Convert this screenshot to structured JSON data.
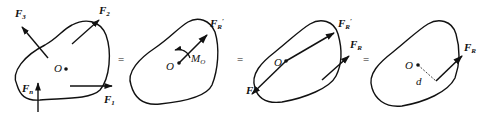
{
  "diagram": {
    "panels": [
      {
        "id": "original-force-system",
        "point": "O",
        "forces": [
          {
            "label": "F",
            "sub": "1"
          },
          {
            "label": "F",
            "sub": "2"
          },
          {
            "label": "F",
            "sub": "3"
          },
          {
            "label": "F",
            "sub": "n"
          }
        ]
      },
      {
        "id": "resultant-and-moment",
        "point": "O",
        "force": {
          "label": "F",
          "sub": "R",
          "prime": "′"
        },
        "moment": {
          "label": "M",
          "sub": "O"
        }
      },
      {
        "id": "couple-replacement",
        "point": "O",
        "forces": [
          {
            "label": "F",
            "sub": "R",
            "prime": "′"
          },
          {
            "label": "F",
            "sub": "R"
          },
          {
            "label": "F",
            "sub": ""
          }
        ]
      },
      {
        "id": "single-resultant",
        "point": "O",
        "force": {
          "label": "F",
          "sub": "R"
        },
        "distance": "d"
      }
    ],
    "equals": [
      "=",
      "=",
      "="
    ]
  }
}
